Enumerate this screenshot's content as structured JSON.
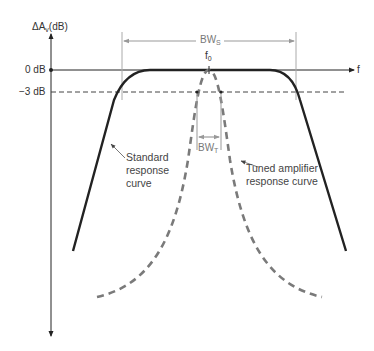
{
  "diagram": {
    "y_axis": {
      "label_main": "ΔA",
      "label_sub": "v",
      "label_unit": "(dB)"
    },
    "x_axis": {
      "label": "f"
    },
    "levels": {
      "zero_db": "0 dB",
      "minus3_db": "−3 dB"
    },
    "center_freq": {
      "main": "f",
      "sub": "0"
    },
    "bandwidths": {
      "standard": {
        "main": "BW",
        "sub": "S"
      },
      "tuned": {
        "main": "BW",
        "sub": "T"
      }
    },
    "curves": {
      "standard": {
        "line1": "Standard",
        "line2": "response",
        "line3": "curve",
        "style": "solid",
        "color": "#222222"
      },
      "tuned": {
        "line1": "Tuned amplifier",
        "line2": "response curve",
        "style": "dashed",
        "color": "#777777"
      }
    }
  }
}
